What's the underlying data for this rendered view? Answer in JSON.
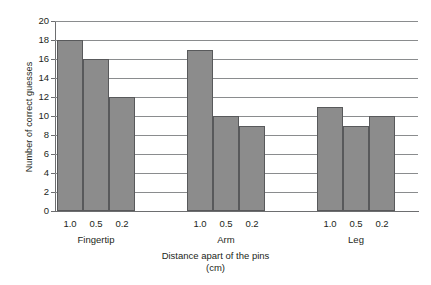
{
  "chart_data": {
    "type": "bar",
    "title": "",
    "xlabel": "Distance apart of the pins (cm)",
    "xlabel_line1": "Distance apart of the pins",
    "xlabel_line2": "(cm)",
    "ylabel": "Number of correct guesses",
    "ylim": [
      0,
      20
    ],
    "ytick_step": 2,
    "yticks": [
      "0",
      "2",
      "4",
      "6",
      "8",
      "10",
      "12",
      "14",
      "16",
      "18",
      "20"
    ],
    "grid": true,
    "grid_axis": "y",
    "legend": false,
    "bar_color": "#8c8c8c",
    "bar_edge_color": "#58595b",
    "grid_color": "#8a8c8e",
    "axis_color": "#6d6e70",
    "categories": [
      "Fingertip",
      "Arm",
      "Leg"
    ],
    "subcategories": [
      "1.0",
      "0.5",
      "0.2"
    ],
    "groups": [
      {
        "label": "Fingertip",
        "bars": [
          {
            "tick": "1.0",
            "value": 18
          },
          {
            "tick": "0.5",
            "value": 16
          },
          {
            "tick": "0.2",
            "value": 12
          }
        ]
      },
      {
        "label": "Arm",
        "bars": [
          {
            "tick": "1.0",
            "value": 17
          },
          {
            "tick": "0.5",
            "value": 10
          },
          {
            "tick": "0.2",
            "value": 9
          }
        ]
      },
      {
        "label": "Leg",
        "bars": [
          {
            "tick": "1.0",
            "value": 11
          },
          {
            "tick": "0.5",
            "value": 9
          },
          {
            "tick": "0.2",
            "value": 10
          }
        ]
      }
    ],
    "series": [
      {
        "name": "1.0",
        "values": [
          18,
          17,
          11
        ]
      },
      {
        "name": "0.5",
        "values": [
          16,
          10,
          9
        ]
      },
      {
        "name": "0.2",
        "values": [
          12,
          9,
          10
        ]
      }
    ]
  }
}
